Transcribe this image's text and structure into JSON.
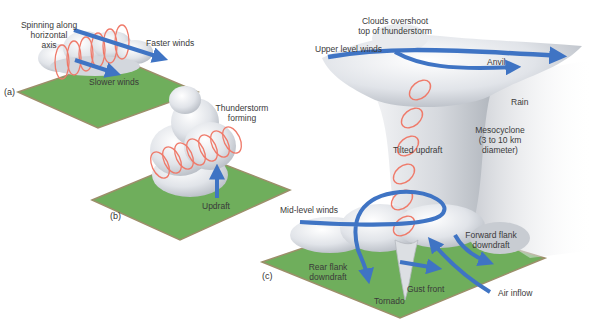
{
  "colors": {
    "ground": "#6fae5c",
    "ground_edge": "#9c8f6a",
    "cloud": "#e4e6ea",
    "cloud_shadow": "#b9bdc4",
    "wind_arrow": "#3f74c4",
    "spiral": "#ef7a6a",
    "text": "#3a3a3a"
  },
  "panels": {
    "a": {
      "tag": "(a)",
      "labels": {
        "spinning": "Spinning along\nhorizontal\naxis",
        "spinning_l1": "Spinning along",
        "spinning_l2": "horizontal",
        "spinning_l3": "axis",
        "faster": "Faster winds",
        "slower": "Slower winds"
      }
    },
    "b": {
      "tag": "(b)",
      "labels": {
        "forming_l1": "Thunderstorm",
        "forming_l2": "forming",
        "updraft": "Updraft"
      }
    },
    "c": {
      "tag": "(c)",
      "labels": {
        "overshoot_l1": "Clouds overshoot",
        "overshoot_l2": "top of thunderstorm",
        "upper_winds": "Upper level winds",
        "anvil": "Anvil",
        "rain": "Rain",
        "meso_l1": "Mesocyclone",
        "meso_l2": "(3 to 10 km",
        "meso_l3": "diameter)",
        "tilted": "Tilted updraft",
        "mid_winds": "Mid-level winds",
        "ffd_l1": "Forward flank",
        "ffd_l2": "downdraft",
        "rfd_l1": "Rear flank",
        "rfd_l2": "downdraft",
        "gust": "Gust front",
        "tornado": "Tornado",
        "inflow": "Air inflow"
      }
    }
  }
}
